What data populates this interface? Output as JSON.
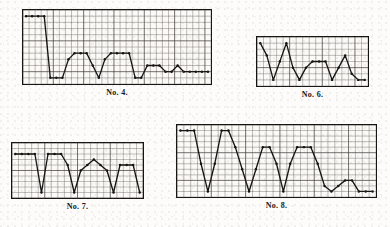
{
  "page": {
    "background_color": "#fdfcfa",
    "ink_color": "#161412",
    "grid_color": "#3a3632",
    "grid_minor_color": "#9a948b"
  },
  "chart_data": [
    {
      "id": "no4",
      "type": "line",
      "title": "No. 4.",
      "xlabel": "",
      "ylabel": "",
      "grid": true,
      "grid_cols": 31,
      "grid_rows": 12,
      "xlim": [
        0,
        31
      ],
      "ylim": [
        0,
        12
      ],
      "markers": true,
      "legend": "none",
      "x": [
        0,
        1,
        2,
        3,
        4,
        5,
        6,
        7,
        8,
        9,
        10,
        11,
        12,
        13,
        14,
        15,
        16,
        17,
        18,
        19,
        20,
        21,
        22,
        23,
        24,
        25,
        26,
        27,
        28,
        29,
        30
      ],
      "values": [
        11,
        11,
        11,
        11,
        1,
        1,
        1,
        4,
        5,
        5,
        5,
        3,
        1,
        4,
        5,
        5,
        5,
        5,
        1,
        1,
        3,
        3,
        3,
        2,
        2,
        3,
        2,
        2,
        2,
        2,
        2
      ]
    },
    {
      "id": "no6",
      "type": "line",
      "title": "No. 6.",
      "xlabel": "",
      "ylabel": "",
      "grid": true,
      "grid_cols": 17,
      "grid_rows": 8,
      "xlim": [
        0,
        17
      ],
      "ylim": [
        0,
        8
      ],
      "markers": true,
      "legend": "none",
      "x": [
        0,
        1,
        2,
        3,
        4,
        5,
        6,
        7,
        8,
        9,
        10,
        11,
        12,
        13,
        14,
        15,
        16
      ],
      "values": [
        7,
        5,
        1,
        4,
        7,
        3,
        1,
        3,
        4,
        4,
        4,
        1,
        3,
        5,
        2,
        1,
        1
      ]
    },
    {
      "id": "no7",
      "type": "line",
      "title": "No. 7.",
      "xlabel": "",
      "ylabel": "",
      "grid": true,
      "grid_cols": 20,
      "grid_rows": 10,
      "xlim": [
        0,
        20
      ],
      "ylim": [
        0,
        10
      ],
      "markers": true,
      "legend": "none",
      "x": [
        0,
        1,
        2,
        3,
        4,
        5,
        6,
        7,
        8,
        9,
        10,
        11,
        12,
        13,
        14,
        15,
        16,
        17,
        18,
        19
      ],
      "values": [
        8,
        8,
        8,
        8,
        1,
        8,
        8,
        8,
        6,
        1,
        5,
        6,
        7,
        6,
        5,
        1,
        6,
        6,
        6,
        1
      ]
    },
    {
      "id": "no8",
      "type": "line",
      "title": "No. 8.",
      "xlabel": "",
      "ylabel": "",
      "grid": true,
      "grid_cols": 29,
      "grid_rows": 13,
      "xlim": [
        0,
        29
      ],
      "ylim": [
        0,
        13
      ],
      "markers": true,
      "legend": "none",
      "x": [
        0,
        1,
        2,
        3,
        4,
        5,
        6,
        7,
        8,
        9,
        10,
        11,
        12,
        13,
        14,
        15,
        16,
        17,
        18,
        19,
        20,
        21,
        22,
        23,
        24,
        25,
        26,
        27,
        28
      ],
      "values": [
        12,
        12,
        12,
        6,
        1,
        6,
        12,
        12,
        9,
        5,
        1,
        5,
        9,
        9,
        6,
        1,
        6,
        9,
        9,
        9,
        6,
        2,
        1,
        2,
        3,
        3,
        1,
        1,
        1
      ]
    }
  ],
  "layout": {
    "charts": [
      {
        "id": "no4",
        "left": 22,
        "top": 9,
        "width": 190,
        "height": 76
      },
      {
        "id": "no6",
        "left": 256,
        "top": 36,
        "width": 113,
        "height": 51
      },
      {
        "id": "no7",
        "left": 11,
        "top": 142,
        "width": 133,
        "height": 57
      },
      {
        "id": "no8",
        "left": 176,
        "top": 124,
        "width": 201,
        "height": 74
      }
    ]
  }
}
